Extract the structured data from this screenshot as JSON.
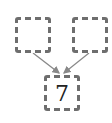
{
  "diagram": {
    "boxes": [
      {
        "id": "top-left",
        "value": ""
      },
      {
        "id": "top-right",
        "value": ""
      },
      {
        "id": "bottom",
        "value": "7"
      }
    ],
    "edges": [
      {
        "from": "top-left",
        "to": "bottom"
      },
      {
        "from": "top-right",
        "to": "bottom"
      }
    ],
    "colors": {
      "border": "#6e6e6e",
      "arrow": "#888888"
    }
  }
}
